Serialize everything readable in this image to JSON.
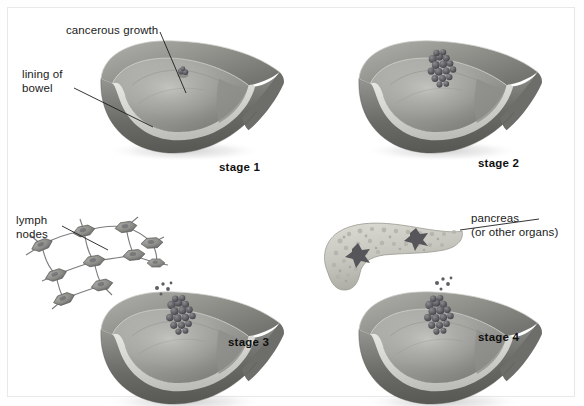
{
  "figure": {
    "type": "medical-illustration",
    "frame_color": "#b9b9b9",
    "background": "#ffffff"
  },
  "labels": {
    "cancerous_growth": "cancerous growth",
    "lining_of_bowel_line1": "lining of",
    "lining_of_bowel_line2": "bowel",
    "lymph_nodes_line1": "lymph",
    "lymph_nodes_line2": "nodes",
    "pancreas_line1": "pancreas",
    "pancreas_line2": "(or other organs)"
  },
  "panels": [
    {
      "id": "stage-1",
      "caption": "stage 1",
      "features": [
        "bowel-tube",
        "small-polyp"
      ],
      "labels": [
        "cancerous growth",
        "lining of bowel"
      ]
    },
    {
      "id": "stage-2",
      "caption": "stage 2",
      "features": [
        "bowel-tube",
        "tumour-cluster"
      ],
      "labels": []
    },
    {
      "id": "stage-3",
      "caption": "stage 3",
      "features": [
        "bowel-tube",
        "tumour-cluster",
        "lymph-node-network",
        "shed-cells"
      ],
      "labels": [
        "lymph nodes"
      ]
    },
    {
      "id": "stage-4",
      "caption": "stage 4",
      "features": [
        "bowel-tube",
        "tumour-cluster",
        "pancreas",
        "shed-cells"
      ],
      "labels": [
        "pancreas (or other organs)"
      ]
    }
  ],
  "colors": {
    "outer_wall_dark": "#6f6f6f",
    "outer_wall_mid": "#8d8d8d",
    "lining_light": "#d8d8d4",
    "cavity_mid": "#a2a29e",
    "cavity_shadow": "#7c7c78",
    "tumour_dark": "#55555a",
    "tumour_mid": "#6e6e72",
    "pancreas_light": "#cfcfc8",
    "pancreas_spot": "#58585a",
    "lymph_node": "#8a8a88",
    "text": "#1b1b1b"
  }
}
